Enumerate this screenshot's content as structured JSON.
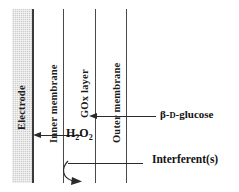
{
  "figure": {
    "background_color": "#ffffff",
    "line_color": "#4a4a4a",
    "electrode_fill": "#cfcfcf"
  },
  "layers": [
    {
      "key": "electrode",
      "label": "Electrode",
      "orientation": "vertical"
    },
    {
      "key": "inner_membrane",
      "label": "Inner membrane",
      "orientation": "vertical"
    },
    {
      "key": "gox_layer",
      "label": "GOx layer",
      "orientation": "vertical"
    },
    {
      "key": "outer_membrane",
      "label": "Outer membrane",
      "orientation": "vertical"
    }
  ],
  "species": {
    "product": {
      "label_prefix": "H",
      "sub1": "2",
      "label_mid": "O",
      "sub2": "2",
      "full": "H2O2",
      "direction": "left"
    },
    "analyte": {
      "greek": "β-",
      "config": "D",
      "name": "-glucose",
      "full": "β-D-glucose",
      "direction": "left"
    },
    "interferent": {
      "label": "Interferent(s)",
      "direction": "blocked-deflected-down"
    }
  },
  "arrows": [
    {
      "name": "h2o2-arrow",
      "from": "gox_layer",
      "to": "electrode",
      "style": "straight-left"
    },
    {
      "name": "glucose-arrow",
      "from": "bulk-solution",
      "to": "gox_layer",
      "style": "straight-left"
    },
    {
      "name": "interferent-arrow",
      "from": "bulk-solution",
      "to": "rejected",
      "style": "curved-down-left"
    }
  ]
}
